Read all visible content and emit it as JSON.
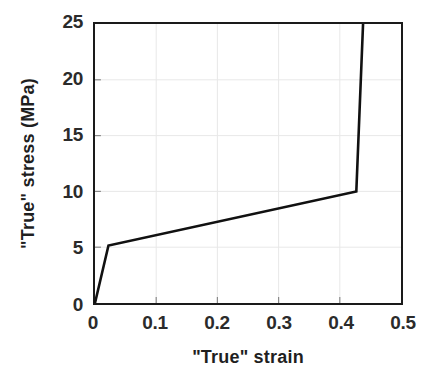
{
  "chart_data": {
    "type": "line",
    "title": "",
    "xlabel": "\"True\" strain",
    "ylabel": "\"True\" stress (MPa)",
    "xlim": [
      0,
      0.5
    ],
    "ylim": [
      0,
      25
    ],
    "xticks": [
      0,
      0.1,
      0.2,
      0.3,
      0.4,
      0.5
    ],
    "xtick_labels": [
      "0",
      "0.1",
      "0.2",
      "0.3",
      "0.4",
      "0.5"
    ],
    "yticks": [
      0,
      5,
      10,
      15,
      20,
      25
    ],
    "ytick_labels": [
      "0",
      "5",
      "10",
      "15",
      "20",
      "25"
    ],
    "grid": true,
    "grid_color": "#e8e8e8",
    "legend": null,
    "series": [
      {
        "name": "true stress-strain curve",
        "color": "#111111",
        "line_width": 2.6,
        "x": [
          0.0,
          0.022,
          0.427,
          0.438
        ],
        "y": [
          0.0,
          5.15,
          10.0,
          25.0
        ],
        "points": [
          {
            "x": 0.0,
            "y": 0.0,
            "role": "origin"
          },
          {
            "x": 0.022,
            "y": 5.15,
            "role": "yield-knee"
          },
          {
            "x": 0.427,
            "y": 10.0,
            "role": "hardening-end-knee"
          },
          {
            "x": 0.438,
            "y": 25.0,
            "role": "steep-rise-top"
          }
        ]
      }
    ]
  },
  "axes": {
    "frame_color": "#1a1a1a",
    "tick_color": "#2b2b2b"
  }
}
